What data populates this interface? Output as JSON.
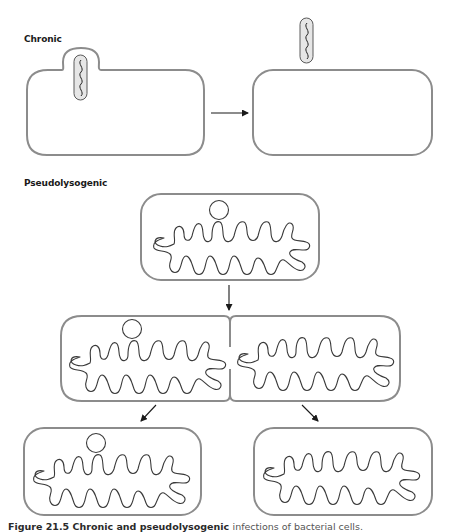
{
  "sections": {
    "chronic": {
      "label": "Chronic"
    },
    "pseudolysogenic": {
      "label": "Pseudolysogenic"
    }
  },
  "caption": {
    "figure_number": "Figure 21.5",
    "title": "Chronic and pseudolysogenic",
    "rest": "infections of bacterial cells.",
    "cropped": true
  },
  "colors": {
    "cell_outline": "#8c8c8c",
    "genome_line": "#3a3a3a",
    "phage_fill": "#e6e6e6",
    "arrow": "#1a1a1a",
    "background": "#ffffff"
  },
  "diagram": {
    "chronic_stages": [
      "infected cell extruding phage",
      "cell after phage release"
    ],
    "pseudolysogenic_stages": [
      "cell with episomal phage genome",
      "dividing cell",
      "daughter cell with phage genome",
      "daughter cell without phage genome"
    ]
  }
}
